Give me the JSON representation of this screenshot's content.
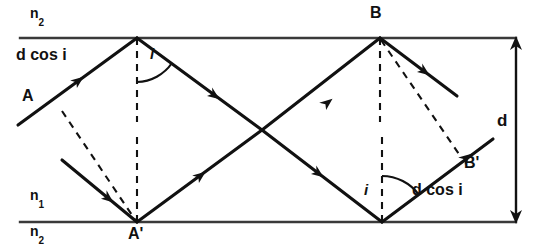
{
  "figure": {
    "type": "optics-ray-diagram",
    "background_color": "#ffffff",
    "stroke_color": "#111111",
    "canvas": {
      "width": 538,
      "height": 250
    }
  },
  "boundaries": {
    "top": {
      "y": 38,
      "x_start": 20,
      "x_end": 516,
      "label_above": "n",
      "label_above_sub": "2"
    },
    "bottom": {
      "y": 222,
      "x_start": 20,
      "x_end": 516,
      "label_above": "n",
      "label_above_sub": "1",
      "label_below": "n",
      "label_below_sub": "2"
    }
  },
  "labels": {
    "n2_top": {
      "base": "n",
      "sub": "2",
      "x": 30,
      "y": 14
    },
    "n1_bottom": {
      "base": "n",
      "sub": "1",
      "x": 30,
      "y": 196
    },
    "n2_bottom": {
      "base": "n",
      "sub": "2",
      "x": 30,
      "y": 226
    },
    "d_cos_i_left": {
      "text": "d cos i",
      "x": 16,
      "y": 56
    },
    "d_cos_i_right": {
      "text": "d cos i",
      "x": 414,
      "y": 190
    },
    "point_A": {
      "text": "A",
      "x": 22,
      "y": 96
    },
    "point_A_prime": {
      "text": "A'",
      "x": 130,
      "y": 228
    },
    "point_B": {
      "text": "B",
      "x": 372,
      "y": 10
    },
    "point_B_prime": {
      "text": "B'",
      "x": 466,
      "y": 163
    },
    "angle_i_top": {
      "text": "i",
      "x": 150,
      "y": 52
    },
    "angle_i_bottom": {
      "text": "i",
      "x": 365,
      "y": 190
    },
    "thickness_d": {
      "text": "d",
      "x": 498,
      "y": 120
    }
  },
  "vertices": {
    "top_left_reflection": {
      "x": 137,
      "y": 38
    },
    "bottom_left_reflection_A_prime": {
      "x": 137,
      "y": 222
    },
    "top_right_reflection_B": {
      "x": 380,
      "y": 38
    },
    "bottom_right_reflection": {
      "x": 382,
      "y": 222
    },
    "ray_crossing": {
      "x": 262,
      "y": 130
    }
  },
  "solid_rays": [
    {
      "name": "incident-ray-A",
      "x1": 18,
      "y1": 125,
      "x2": 137,
      "y2": 38,
      "arrow_at": 0.62
    },
    {
      "name": "reflected-ray-top-left-down",
      "x1": 137,
      "y1": 38,
      "x2": 262,
      "y2": 130,
      "arrow_at": 0.62
    },
    {
      "name": "ray-down-to-bottom-right",
      "x1": 262,
      "y1": 130,
      "x2": 382,
      "y2": 222,
      "arrow_at": 0.55
    },
    {
      "name": "second-incident-ray",
      "x1": 62,
      "y1": 160,
      "x2": 137,
      "y2": 222,
      "arrow_at": 0.6
    },
    {
      "name": "reflected-ray-A-prime-up",
      "x1": 137,
      "y1": 222,
      "x2": 262,
      "y2": 130,
      "arrow_at": 0.45
    },
    {
      "name": "ray-up-to-B",
      "x1": 262,
      "y1": 130,
      "x2": 380,
      "y2": 38,
      "arrow_at": 0.55
    },
    {
      "name": "reflected-ray-from-B-down-right",
      "x1": 380,
      "y1": 38,
      "x2": 456,
      "y2": 96,
      "arrow_at": 0.55
    },
    {
      "name": "reflected-ray-from-bottom-right-up",
      "x1": 382,
      "y1": 222,
      "x2": 492,
      "y2": 140,
      "arrow_at": 0.72
    }
  ],
  "dashed_normals": [
    {
      "name": "normal-top-left",
      "x1": 137,
      "y1": 38,
      "x2": 137,
      "y2": 120
    },
    {
      "name": "normal-bottom-left",
      "x1": 137,
      "y1": 222,
      "x2": 137,
      "y2": 136
    },
    {
      "name": "normal-top-right-B",
      "x1": 380,
      "y1": 38,
      "x2": 380,
      "y2": 120
    },
    {
      "name": "normal-bottom-right",
      "x1": 382,
      "y1": 222,
      "x2": 382,
      "y2": 136
    }
  ],
  "dashed_perpendiculars": [
    {
      "name": "perpendicular-A-to-A-prime",
      "x1": 62,
      "y1": 112,
      "x2": 137,
      "y2": 222
    },
    {
      "name": "perpendicular-B-to-B-prime",
      "x1": 380,
      "y1": 40,
      "x2": 462,
      "y2": 156
    }
  ],
  "angle_arcs": [
    {
      "name": "angle-arc-top-left",
      "cx": 137,
      "cy": 38,
      "radius": 44,
      "start_deg": 90,
      "end_deg": 37
    },
    {
      "name": "angle-arc-bottom-right",
      "cx": 382,
      "cy": 222,
      "radius": 46,
      "start_deg": 270,
      "end_deg": 323
    }
  ],
  "dimension_arrow": {
    "name": "thickness-dimension-d",
    "x": 516,
    "y_top": 40,
    "y_bottom": 222,
    "double_headed": true
  }
}
